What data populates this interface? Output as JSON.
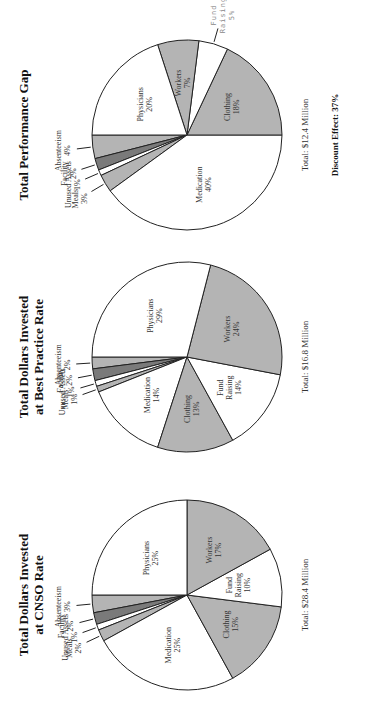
{
  "charts": [
    {
      "id": "cnso",
      "title_line1": "Total Dollars Invested",
      "title_line2": "at CNSO Rate",
      "total": "Total: $28.4 Million",
      "discount": null
    },
    {
      "id": "best",
      "title_line1": "Total Dollars Invested",
      "title_line2": "at Best Practice Rate",
      "total": "Total: $16.8 Million",
      "discount": null
    },
    {
      "id": "gap",
      "title_line1": "Total Performance Gap",
      "title_line2": "",
      "total": "Total: $12.4 Million",
      "discount": "Discount Effect: 37%"
    }
  ],
  "chart_data": [
    {
      "type": "pie",
      "title": "Total Dollars Invested at CNSO Rate",
      "annotation": "Total: $28.4 Million",
      "categories": [
        "Absenteeism",
        "Facility",
        "Unused Assets",
        "Meals",
        "Medication",
        "Clothing",
        "Fund Raising",
        "Workers",
        "Physicians"
      ],
      "values": [
        3,
        2,
        1,
        2,
        25,
        15,
        10,
        17,
        25
      ],
      "labels": [
        "3%",
        "2%",
        "1%",
        "2%",
        "25%",
        "15%",
        "10%",
        "17%",
        "25%"
      ],
      "colors": [
        "#b4b4b4",
        "#7a7a7a",
        "#ffffff",
        "#b4b4b4",
        "#ffffff",
        "#b4b4b4",
        "#ffffff",
        "#b4b4b4",
        "#ffffff"
      ]
    },
    {
      "type": "pie",
      "title": "Total Dollars Invested at Best Practice Rate",
      "annotation": "Total: $16.8 Million",
      "categories": [
        "Absenteeism",
        "Facility",
        "Unused Assets",
        "Meals",
        "Medication",
        "Clothing",
        "Fund Raising",
        "Workers",
        "Physicians"
      ],
      "values": [
        2,
        2,
        1,
        1,
        14,
        13,
        14,
        24,
        29
      ],
      "labels": [
        "2%",
        "2%",
        "1%",
        "1%",
        "14%",
        "13%",
        "14%",
        "24%",
        "29%"
      ],
      "colors": [
        "#b4b4b4",
        "#7a7a7a",
        "#ffffff",
        "#b4b4b4",
        "#ffffff",
        "#b4b4b4",
        "#ffffff",
        "#b4b4b4",
        "#ffffff"
      ]
    },
    {
      "type": "pie",
      "title": "Total Performance Gap",
      "annotation": "Total: $12.4 Million; Discount Effect: 37%",
      "categories": [
        "Absenteeism",
        "Facility",
        "Unused Assets",
        "Meals",
        "Medication",
        "Clothing",
        "Fund Raising",
        "Workers",
        "Physicians"
      ],
      "values": [
        4,
        2,
        1,
        3,
        40,
        18,
        5,
        7,
        20
      ],
      "labels": [
        "4%",
        "2%",
        "1%",
        "3%",
        "40%",
        "18%",
        "5%",
        "7%",
        "20%"
      ],
      "colors": [
        "#b4b4b4",
        "#7a7a7a",
        "#ffffff",
        "#b4b4b4",
        "#ffffff",
        "#b4b4b4",
        "#ffffff",
        "#b4b4b4",
        "#ffffff"
      ]
    }
  ]
}
